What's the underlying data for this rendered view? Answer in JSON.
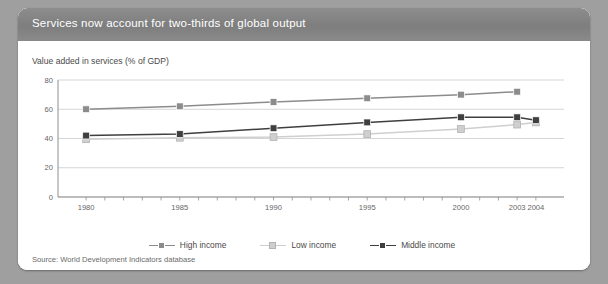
{
  "figure": {
    "title": "Services now account for two-thirds of global output",
    "axis_title": "Value added in services (% of GDP)",
    "source": "Source: World Development Indicators database"
  },
  "legend": {
    "position": "bottom-center",
    "items": [
      {
        "label": "High income",
        "color": "#8c8c8c"
      },
      {
        "label": "Low income",
        "color": "#cfcfcf"
      },
      {
        "label": "Middle income",
        "color": "#3f3f3f"
      }
    ]
  },
  "colors": {
    "page_background": "#9f9f9f",
    "card_background": "#ffffff",
    "title_bar": "#858585",
    "title_text": "#ffffff",
    "gridline": "#d5d5d5",
    "axis": "#8f8f8f",
    "tick_label": "#666666",
    "high_income": "#8c8c8c",
    "low_income": "#cfcfcf",
    "middle_income": "#3f3f3f"
  },
  "chart_data": {
    "type": "line",
    "title": "Services now account for two-thirds of global output",
    "xlabel": "",
    "ylabel": "Value added in services (% of GDP)",
    "x": [
      1980,
      1985,
      1990,
      1995,
      2000,
      2003,
      2004
    ],
    "xtick_labels": [
      "1980",
      "1985",
      "1990",
      "1995",
      "2000",
      "2003",
      "2004"
    ],
    "xlim": [
      1978.5,
      2005.5
    ],
    "ylim": [
      0,
      80
    ],
    "ytick_labels": [
      "0",
      "20",
      "40",
      "60",
      "80"
    ],
    "yticks": [
      0,
      20,
      40,
      60,
      80
    ],
    "grid": "horizontal",
    "minor_xticks": [
      1980,
      1981,
      1982,
      1983,
      1984,
      1985,
      1986,
      1987,
      1988,
      1989,
      1990,
      1991,
      1992,
      1993,
      1994,
      1995,
      1996,
      1997,
      1998,
      1999,
      2000,
      2001,
      2002,
      2003,
      2004
    ],
    "series": [
      {
        "name": "High income",
        "color": "#8c8c8c",
        "x": [
          1980,
          1985,
          1990,
          1995,
          2000,
          2003
        ],
        "values": [
          60,
          62,
          65,
          67.5,
          70,
          72
        ]
      },
      {
        "name": "Low income",
        "color": "#cfcfcf",
        "x": [
          1980,
          1985,
          1990,
          1995,
          2000,
          2003,
          2004
        ],
        "values": [
          39.5,
          40.5,
          41,
          43,
          46.5,
          49.5,
          51
        ]
      },
      {
        "name": "Middle income",
        "color": "#3f3f3f",
        "x": [
          1980,
          1985,
          1990,
          1995,
          2000,
          2003,
          2004
        ],
        "values": [
          42,
          43,
          47,
          51,
          54.5,
          54.5,
          52.5
        ]
      }
    ]
  }
}
